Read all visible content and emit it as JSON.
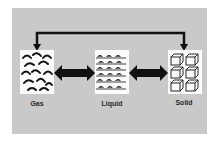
{
  "diagram": {
    "title": "",
    "states": [
      {
        "id": "gas",
        "label": "Gas",
        "icon": "gas-particles-icon"
      },
      {
        "id": "liquid",
        "label": "Liquid",
        "icon": "liquid-waves-icon"
      },
      {
        "id": "solid",
        "label": "Solid",
        "icon": "solid-cubes-icon"
      }
    ],
    "connections": [
      {
        "from": "gas",
        "to": "liquid",
        "type": "double-arrow"
      },
      {
        "from": "liquid",
        "to": "solid",
        "type": "double-arrow"
      },
      {
        "from": "solid",
        "to": "gas",
        "type": "bracket-double-arrow-over-top"
      }
    ],
    "colors": {
      "panel": "#c9c9c9",
      "box": "#fbfbfb",
      "ink": "#111111"
    }
  }
}
